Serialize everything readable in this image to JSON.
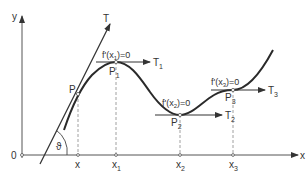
{
  "diagram": {
    "axes": {
      "y_label": "y",
      "x_label": "x",
      "origin_label": "0"
    },
    "x_ticks": [
      "x",
      "x1",
      "x2",
      "x3"
    ],
    "x_tick_labels": {
      "x": {
        "base": "x",
        "sub": ""
      },
      "x1": {
        "base": "x",
        "sub": "1"
      },
      "x2": {
        "base": "x",
        "sub": "2"
      },
      "x3": {
        "base": "x",
        "sub": "3"
      }
    },
    "points": {
      "P": {
        "base": "P",
        "sub": ""
      },
      "P1": {
        "base": "P",
        "sub": "1"
      },
      "P2": {
        "base": "P",
        "sub": "2"
      },
      "P3": {
        "base": "P",
        "sub": "3"
      }
    },
    "tangents": {
      "T": {
        "base": "T",
        "sub": ""
      },
      "T1": {
        "base": "T",
        "sub": "1"
      },
      "T2": {
        "base": "T",
        "sub": "2"
      },
      "T3": {
        "base": "T",
        "sub": "3"
      }
    },
    "annotations": {
      "f1": {
        "pre": "f'(x",
        "sub": "1",
        "post": ")=0"
      },
      "f2": {
        "pre": "f'(x",
        "sub": "2",
        "post": ")=0"
      },
      "f3": {
        "pre": "f'(x",
        "sub": "3",
        "post": ")=0"
      }
    },
    "angle_label": "ϑ"
  }
}
